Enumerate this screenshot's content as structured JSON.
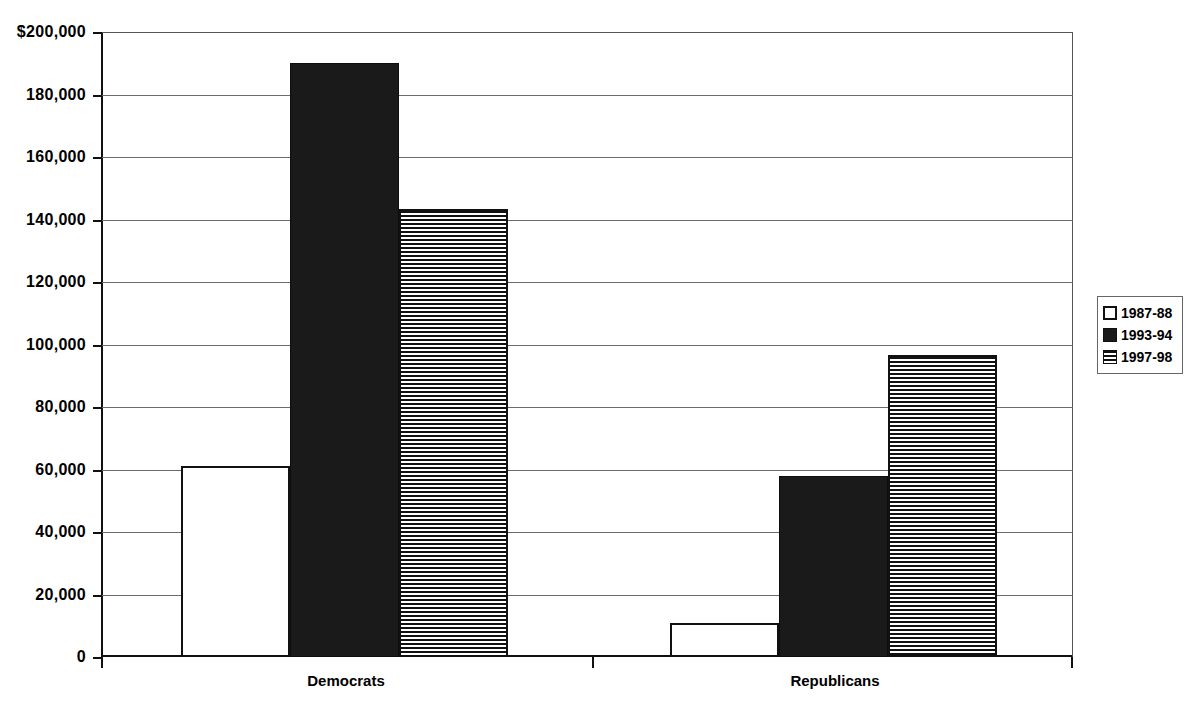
{
  "chart_data": {
    "type": "bar",
    "title": "",
    "xlabel": "",
    "ylabel": "",
    "ylim": [
      0,
      200000
    ],
    "grid": true,
    "legend_position": "right",
    "categories": [
      "Democrats",
      "Republicans"
    ],
    "y_ticks": [
      {
        "value": 200000,
        "label": "$200,000"
      },
      {
        "value": 180000,
        "label": "180,000"
      },
      {
        "value": 160000,
        "label": "160,000"
      },
      {
        "value": 140000,
        "label": "140,000"
      },
      {
        "value": 120000,
        "label": "120,000"
      },
      {
        "value": 100000,
        "label": "100,000"
      },
      {
        "value": 80000,
        "label": "80,000"
      },
      {
        "value": 60000,
        "label": "60,000"
      },
      {
        "value": 40000,
        "label": "40,000"
      },
      {
        "value": 20000,
        "label": "20,000"
      },
      {
        "value": 0,
        "label": "0"
      }
    ],
    "series": [
      {
        "name": "1987-88",
        "fill": "white",
        "values": [
          61000,
          11000
        ]
      },
      {
        "name": "1993-94",
        "fill": "solid",
        "values": [
          190000,
          58000
        ]
      },
      {
        "name": "1997-98",
        "fill": "striped",
        "values": [
          143500,
          96500
        ]
      }
    ]
  },
  "legend": {
    "items": [
      {
        "label": "1987-88",
        "fill": "white"
      },
      {
        "label": "1993-94",
        "fill": "solid"
      },
      {
        "label": "1997-98",
        "fill": "striped"
      }
    ]
  },
  "colors": {
    "axis": "#111111",
    "gridline": "#6b6b6b",
    "bar_solid": "#1a1a1a",
    "bar_white": "#ffffff",
    "background": "#ffffff"
  }
}
